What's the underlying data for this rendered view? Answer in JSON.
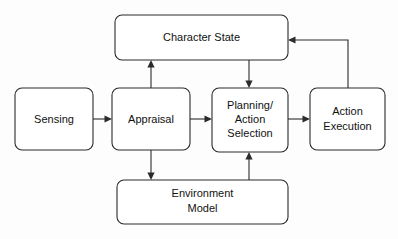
{
  "diagram": {
    "background_color": "#fdfdfd",
    "stroke_color": "#2b2b2b",
    "box_fill_color": "#ffffff",
    "text_color": "#111111",
    "nodes": [
      {
        "id": "character-state",
        "label": "Character State",
        "lines": [
          "Character State"
        ],
        "x": 115,
        "y": 15,
        "width": 173,
        "height": 45
      },
      {
        "id": "sensing",
        "label": "Sensing",
        "lines": [
          "Sensing"
        ],
        "x": 15,
        "y": 88,
        "width": 78,
        "height": 62
      },
      {
        "id": "appraisal",
        "label": "Appraisal",
        "lines": [
          "Appraisal"
        ],
        "x": 112,
        "y": 88,
        "width": 78,
        "height": 62
      },
      {
        "id": "planning-action-selection",
        "label": "Planning/ Action Selection",
        "lines": [
          "Planning/",
          "Action",
          "Selection"
        ],
        "x": 212,
        "y": 88,
        "width": 76,
        "height": 64
      },
      {
        "id": "action-execution",
        "label": "Action Execution",
        "lines": [
          "Action",
          "Execution"
        ],
        "x": 310,
        "y": 88,
        "width": 75,
        "height": 62
      },
      {
        "id": "environment-model",
        "label": "Environment Model",
        "lines": [
          "Environment",
          "Model"
        ],
        "x": 117,
        "y": 180,
        "width": 171,
        "height": 44
      }
    ],
    "edges": [
      {
        "id": "sensing-to-appraisal",
        "from": "sensing",
        "to": "appraisal",
        "direction": "right"
      },
      {
        "id": "appraisal-to-planning",
        "from": "appraisal",
        "to": "planning-action-selection",
        "direction": "right"
      },
      {
        "id": "planning-to-action-execution",
        "from": "planning-action-selection",
        "to": "action-execution",
        "direction": "right"
      },
      {
        "id": "appraisal-to-character-state",
        "from": "appraisal",
        "to": "character-state",
        "direction": "up"
      },
      {
        "id": "character-state-to-planning",
        "from": "character-state",
        "to": "planning-action-selection",
        "direction": "down"
      },
      {
        "id": "appraisal-to-environment-model",
        "from": "appraisal",
        "to": "environment-model",
        "direction": "down"
      },
      {
        "id": "environment-model-to-planning",
        "from": "environment-model",
        "to": "planning-action-selection",
        "direction": "up"
      },
      {
        "id": "action-execution-to-character-state",
        "from": "action-execution",
        "to": "character-state",
        "direction": "left",
        "routing": "elbow"
      }
    ]
  }
}
